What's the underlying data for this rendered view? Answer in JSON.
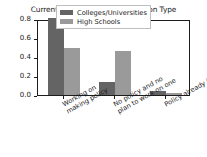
{
  "chart_data": {
    "type": "bar",
    "title": "Current Policy Status by Institution Type",
    "xlabel": "",
    "ylabel": "Fraction of Respondents",
    "categories": [
      "Working on\nmaking policy",
      "No policy and no\nplan to work on one",
      "Policy already in place"
    ],
    "category_lines": [
      [
        "Working on",
        "making policy"
      ],
      [
        "No policy and no",
        "plan to work on one"
      ],
      [
        "Policy already in place"
      ]
    ],
    "series": [
      {
        "name": "Colleges/Universities",
        "color": "#646464",
        "values": [
          0.81,
          0.14,
          0.045
        ]
      },
      {
        "name": "High Schools",
        "color": "#9a9a9a",
        "values": [
          0.49,
          0.46,
          0.025
        ]
      }
    ],
    "ylim": [
      0.0,
      0.8
    ],
    "yticks": [
      0.0,
      0.2,
      0.4,
      0.6,
      0.8
    ],
    "ytick_labels": [
      "0.0",
      "0.2",
      "0.4",
      "0.6",
      "0.8"
    ],
    "grid": false,
    "legend_position": "upper center",
    "xtick_rotation": -29
  }
}
